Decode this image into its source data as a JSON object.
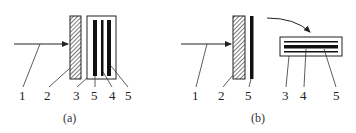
{
  "diagram": {
    "panels": [
      {
        "id": "a",
        "caption": "(a)",
        "labels": [
          "1",
          "2",
          "3",
          "5",
          "4",
          "5"
        ]
      },
      {
        "id": "b",
        "caption": "(b)",
        "labels": [
          "1",
          "2",
          "5",
          "3",
          "4",
          "5"
        ]
      }
    ],
    "colors": {
      "stroke": "#222222",
      "bar": "#111111",
      "background": "#ffffff"
    }
  }
}
